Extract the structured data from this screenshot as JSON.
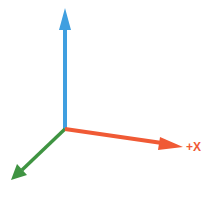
{
  "diagram": {
    "type": "3d-axis-gizmo",
    "origin": {
      "x": 65,
      "y": 129
    },
    "axes": [
      {
        "name": "x",
        "label": "+X",
        "color": "#f05a35",
        "end": {
          "x": 183,
          "y": 147
        }
      },
      {
        "name": "y",
        "label": "",
        "color": "#3f9fe0",
        "end": {
          "x": 65,
          "y": 8
        }
      },
      {
        "name": "z",
        "label": "",
        "color": "#3f9442",
        "end": {
          "x": 11,
          "y": 180
        }
      }
    ]
  },
  "labels": {
    "x_axis": "+X"
  },
  "colors": {
    "x_axis": "#f05a35",
    "y_axis": "#3f9fe0",
    "z_axis": "#3f9442",
    "background": "#ffffff"
  }
}
